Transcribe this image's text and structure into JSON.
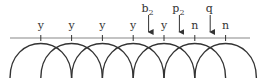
{
  "diagram": {
    "tick_labels": [
      "y",
      "y",
      "y",
      "y",
      "y",
      "n",
      "n"
    ],
    "arrows": [
      {
        "base": "b",
        "sub": "2",
        "between_ticks": [
          4,
          5
        ]
      },
      {
        "base": "p",
        "sub": "2",
        "between_ticks": [
          5,
          6
        ]
      },
      {
        "base": "q",
        "sub": "",
        "between_ticks": [
          6,
          7
        ]
      }
    ],
    "colors": {
      "line": "#888888",
      "arc": "#333333",
      "text": "#333333"
    }
  }
}
